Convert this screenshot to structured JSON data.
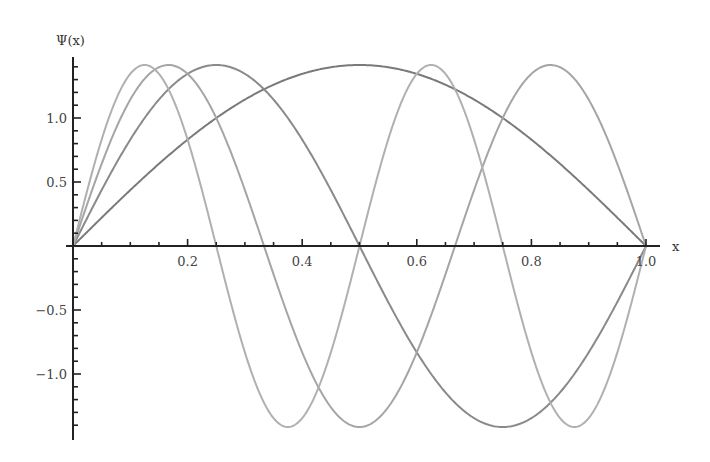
{
  "chart_data": {
    "type": "line",
    "title": "",
    "xlabel": "x",
    "ylabel": "Ψ(x)",
    "xlim": [
      0,
      1.0
    ],
    "ylim": [
      -1.5,
      1.5
    ],
    "grid": false,
    "legend": null,
    "x_ticks": [
      {
        "value": 0.2,
        "label": "0.2"
      },
      {
        "value": 0.4,
        "label": "0.4"
      },
      {
        "value": 0.6,
        "label": "0.6"
      },
      {
        "value": 0.8,
        "label": "0.8"
      },
      {
        "value": 1.0,
        "label": "1.0"
      }
    ],
    "y_ticks": [
      {
        "value": 1.0,
        "label": "1.0"
      },
      {
        "value": 0.5,
        "label": "0.5"
      },
      {
        "value": -0.5,
        "label": "-0.5"
      },
      {
        "value": -1.0,
        "label": "-1.0"
      }
    ],
    "x_minor_step": 0.05,
    "y_minor_step": 0.1,
    "series": [
      {
        "name": "n=1",
        "formula": "sqrt(2)*sin(1*pi*x)",
        "n": 1,
        "amplitude": 1.414,
        "color": "#7a7a7a",
        "x": [
          0,
          0.125,
          0.25,
          0.375,
          0.5,
          0.625,
          0.75,
          0.875,
          1.0
        ],
        "values": [
          0,
          0.54,
          1.0,
          1.31,
          1.414,
          1.31,
          1.0,
          0.54,
          0
        ]
      },
      {
        "name": "n=2",
        "formula": "sqrt(2)*sin(2*pi*x)",
        "n": 2,
        "amplitude": 1.414,
        "color": "#8a8a8a",
        "x": [
          0,
          0.125,
          0.25,
          0.375,
          0.5,
          0.625,
          0.75,
          0.875,
          1.0
        ],
        "values": [
          0,
          1.0,
          1.414,
          1.0,
          0,
          -1.0,
          -1.414,
          -1.0,
          0
        ]
      },
      {
        "name": "n=3",
        "formula": "sqrt(2)*sin(3*pi*x)",
        "n": 3,
        "amplitude": 1.414,
        "color": "#a5a5a5",
        "x": [
          0,
          0.1667,
          0.3333,
          0.5,
          0.6667,
          0.8333,
          1.0
        ],
        "values": [
          0,
          1.414,
          0,
          -1.414,
          0,
          1.414,
          0
        ]
      },
      {
        "name": "n=4",
        "formula": "sqrt(2)*sin(4*pi*x)",
        "n": 4,
        "amplitude": 1.414,
        "color": "#b0b0b0",
        "x": [
          0,
          0.125,
          0.25,
          0.375,
          0.5,
          0.625,
          0.75,
          0.875,
          1.0
        ],
        "values": [
          0,
          1.414,
          0,
          -1.414,
          0,
          1.414,
          0,
          -1.414,
          0
        ]
      }
    ]
  },
  "layout": {
    "x0_px": 73,
    "x1_px": 646,
    "y0_px": 246,
    "unit_px": 128,
    "yaxis_top_px": 57,
    "yaxis_bottom_px": 440,
    "xaxis_left_px": 66,
    "xaxis_right_px": 660
  }
}
